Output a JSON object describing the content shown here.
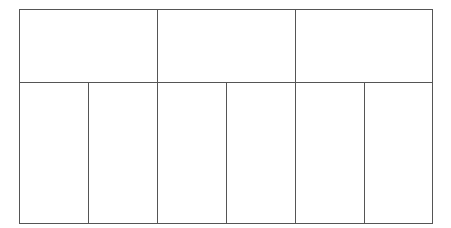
{
  "diagram": {
    "type": "grid-table",
    "line_color": "#555555",
    "background": "#ffffff",
    "rows": [
      {
        "name": "top-row",
        "cells": [
          {
            "label": "",
            "colspan": 2
          },
          {
            "label": "",
            "colspan": 2
          },
          {
            "label": "",
            "colspan": 2
          }
        ]
      },
      {
        "name": "bottom-row",
        "cells": [
          {
            "label": "",
            "colspan": 1
          },
          {
            "label": "",
            "colspan": 1
          },
          {
            "label": "",
            "colspan": 1
          },
          {
            "label": "",
            "colspan": 1
          },
          {
            "label": "",
            "colspan": 1
          },
          {
            "label": "",
            "colspan": 1
          }
        ]
      }
    ]
  }
}
